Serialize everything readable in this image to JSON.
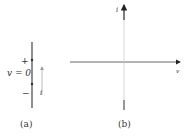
{
  "panel_a": {
    "caption": "(a)",
    "plus": "+",
    "minus": "−",
    "voltage_label": "v = 0",
    "current_label": "i"
  },
  "panel_b": {
    "caption": "(b)",
    "y_axis_label": "i",
    "x_axis_label": "v"
  },
  "colors": {
    "stroke": "#333333",
    "light_stroke": "#b0b0b0"
  }
}
